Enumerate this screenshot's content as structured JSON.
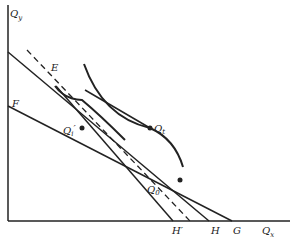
{
  "diagram": {
    "type": "indifference-curve budget-line diagram",
    "axes": {
      "y_label": "Q",
      "y_sub": "y",
      "x_label": "Q",
      "x_sub": "x"
    },
    "points": {
      "E": "E",
      "F": "F",
      "Qt": "Q",
      "Qt_sub": "t",
      "Qi": "Q",
      "Qi_sub": "i",
      "Qi_prime": "′",
      "Q0": "Q",
      "Q0_sub": "0",
      "H_prime": "H′",
      "H": "H",
      "G": "G"
    },
    "colors": {
      "line": "#222222",
      "background": "#ffffff"
    }
  }
}
